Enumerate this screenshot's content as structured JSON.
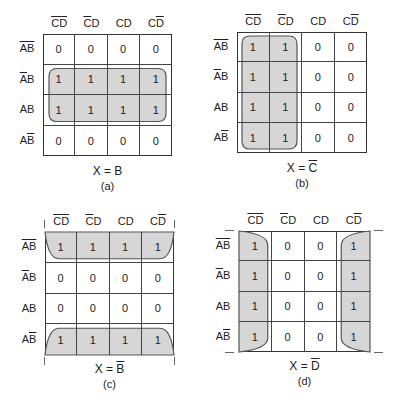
{
  "columns": [
    {
      "parts": [
        {
          "t": "C",
          "bar": true
        },
        {
          "t": "D",
          "bar": true
        }
      ]
    },
    {
      "parts": [
        {
          "t": "C",
          "bar": true
        },
        {
          "t": "D",
          "bar": false
        }
      ]
    },
    {
      "parts": [
        {
          "t": "C",
          "bar": false
        },
        {
          "t": "D",
          "bar": false
        }
      ]
    },
    {
      "parts": [
        {
          "t": "C",
          "bar": false
        },
        {
          "t": "D",
          "bar": true
        }
      ]
    }
  ],
  "rows": [
    {
      "parts": [
        {
          "t": "A",
          "bar": true
        },
        {
          "t": "B",
          "bar": true
        }
      ]
    },
    {
      "parts": [
        {
          "t": "A",
          "bar": true
        },
        {
          "t": "B",
          "bar": false
        }
      ]
    },
    {
      "parts": [
        {
          "t": "A",
          "bar": false
        },
        {
          "t": "B",
          "bar": false
        }
      ]
    },
    {
      "parts": [
        {
          "t": "A",
          "bar": false
        },
        {
          "t": "B",
          "bar": true
        }
      ]
    }
  ],
  "column_labels_text": [
    "C̄D̄",
    "C̄D",
    "CD",
    "CD̄"
  ],
  "row_labels_text": [
    "ĀB̄",
    "ĀB",
    "AB",
    "AB̄"
  ],
  "maps": [
    {
      "id": "a",
      "expression_lhs": "X = ",
      "expression_var": "B",
      "expression_bar": false,
      "label": "(a)",
      "cells": [
        [
          0,
          0,
          0,
          0
        ],
        [
          1,
          1,
          1,
          1
        ],
        [
          1,
          1,
          1,
          1
        ],
        [
          0,
          0,
          0,
          0
        ]
      ],
      "group": "rows 2-3 (B)"
    },
    {
      "id": "b",
      "expression_lhs": "X = ",
      "expression_var": "C",
      "expression_bar": true,
      "label": "(b)",
      "cells": [
        [
          1,
          1,
          0,
          0
        ],
        [
          1,
          1,
          0,
          0
        ],
        [
          1,
          1,
          0,
          0
        ],
        [
          1,
          1,
          0,
          0
        ]
      ],
      "group": "columns 1-2 (C̄)"
    },
    {
      "id": "c",
      "expression_lhs": "X = ",
      "expression_var": "B",
      "expression_bar": true,
      "label": "(c)",
      "cells": [
        [
          1,
          1,
          1,
          1
        ],
        [
          0,
          0,
          0,
          0
        ],
        [
          0,
          0,
          0,
          0
        ],
        [
          1,
          1,
          1,
          1
        ]
      ],
      "group": "rows 1 and 4 wrap-around (B̄)"
    },
    {
      "id": "d",
      "expression_lhs": "X = ",
      "expression_var": "D",
      "expression_bar": true,
      "label": "(d)",
      "cells": [
        [
          1,
          0,
          0,
          1
        ],
        [
          1,
          0,
          0,
          1
        ],
        [
          1,
          0,
          0,
          1
        ],
        [
          1,
          0,
          0,
          1
        ]
      ],
      "group": "columns 1 and 4 wrap-around (D̄)"
    }
  ],
  "colors": {
    "group_fill": "#d6d6d6",
    "grid_line": "#333333",
    "background": "#ffffff"
  }
}
